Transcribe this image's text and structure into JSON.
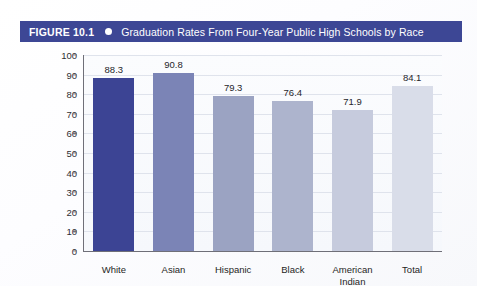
{
  "figure": {
    "number_label": "FIGURE 10.1",
    "bullet_icon": "circle-bullet-icon",
    "title": "Graduation Rates From Four-Year Public High Schools by Race",
    "header_background_color": "#3d4795",
    "header_text_color": "#ffffff"
  },
  "chart_data": {
    "type": "bar",
    "title": "Graduation Rates From Four-Year Public High Schools by Race",
    "xlabel": "",
    "ylabel": "",
    "ylim": [
      0,
      100
    ],
    "ytick_step": 10,
    "yticks": [
      0,
      10,
      20,
      30,
      40,
      50,
      60,
      70,
      80,
      90,
      100
    ],
    "grid": true,
    "legend": "none",
    "categories": [
      "White",
      "Asian",
      "Hispanic",
      "Black",
      "American Indian",
      "Total"
    ],
    "category_lines": [
      [
        "White"
      ],
      [
        "Asian"
      ],
      [
        "Hispanic"
      ],
      [
        "Black"
      ],
      [
        "American",
        "Indian"
      ],
      [
        "Total"
      ]
    ],
    "values": [
      88.3,
      90.8,
      79.3,
      76.4,
      71.9,
      84.1
    ],
    "value_labels": [
      "88.3",
      "90.8",
      "79.3",
      "76.4",
      "71.9",
      "84.1"
    ],
    "bar_colors": [
      "#3c4494",
      "#7b84b6",
      "#9ba3c2",
      "#adb4cd",
      "#c6cbdd",
      "#d9dde9"
    ]
  }
}
